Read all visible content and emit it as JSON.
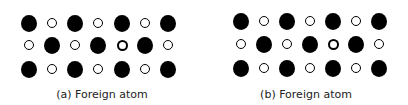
{
  "panels": [
    {
      "caption": "(a) Foreign atom",
      "offset_x": 0,
      "rows": [
        {
          "y": 23,
          "atoms": [
            {
              "x": 29,
              "t": "large"
            },
            {
              "x": 52,
              "t": "small"
            },
            {
              "x": 75,
              "t": "large"
            },
            {
              "x": 98,
              "t": "small"
            },
            {
              "x": 122,
              "t": "large"
            },
            {
              "x": 145,
              "t": "small"
            },
            {
              "x": 168,
              "t": "large"
            }
          ]
        },
        {
          "y": 45,
          "atoms": [
            {
              "x": 29,
              "t": "small"
            },
            {
              "x": 52,
              "t": "large"
            },
            {
              "x": 75,
              "t": "small"
            },
            {
              "x": 98,
              "t": "large"
            },
            {
              "x": 122,
              "t": "foreign"
            },
            {
              "x": 145,
              "t": "large"
            },
            {
              "x": 168,
              "t": "small"
            }
          ]
        },
        {
          "y": 69,
          "atoms": [
            {
              "x": 29,
              "t": "large"
            },
            {
              "x": 52,
              "t": "small"
            },
            {
              "x": 75,
              "t": "large"
            },
            {
              "x": 98,
              "t": "small"
            },
            {
              "x": 122,
              "t": "large"
            },
            {
              "x": 145,
              "t": "small"
            },
            {
              "x": 168,
              "t": "large"
            }
          ]
        }
      ]
    },
    {
      "caption": "(b) Foreign atom",
      "offset_x": 204,
      "rows": [
        {
          "y": 21,
          "atoms": [
            {
              "x": 37,
              "t": "large"
            },
            {
              "x": 60,
              "t": "small"
            },
            {
              "x": 83,
              "t": "large"
            },
            {
              "x": 106,
              "t": "small"
            },
            {
              "x": 129,
              "t": "large"
            },
            {
              "x": 152,
              "t": "small"
            },
            {
              "x": 175,
              "t": "large"
            }
          ]
        },
        {
          "y": 44,
          "atoms": [
            {
              "x": 37,
              "t": "small"
            },
            {
              "x": 60,
              "t": "large"
            },
            {
              "x": 83,
              "t": "small"
            },
            {
              "x": 106,
              "t": "large"
            },
            {
              "x": 129,
              "t": "foreign"
            },
            {
              "x": 152,
              "t": "large"
            },
            {
              "x": 175,
              "t": "small"
            }
          ]
        },
        {
          "y": 68,
          "atoms": [
            {
              "x": 37,
              "t": "large"
            },
            {
              "x": 60,
              "t": "small"
            },
            {
              "x": 83,
              "t": "large"
            },
            {
              "x": 106,
              "t": "small"
            },
            {
              "x": 129,
              "t": "large"
            },
            {
              "x": 152,
              "t": "small"
            },
            {
              "x": 175,
              "t": "large"
            }
          ]
        }
      ]
    }
  ],
  "legend": {
    "large": "host atom (large, filled)",
    "small": "host atom (small, hollow)",
    "foreign": "foreign atom (thick ring)"
  }
}
